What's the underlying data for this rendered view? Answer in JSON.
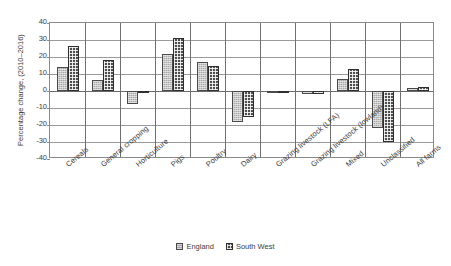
{
  "chart_data": {
    "type": "bar",
    "title": "",
    "xlabel": "",
    "ylabel": "Percentage change, (2010–2016)",
    "ylim": [
      -40,
      40
    ],
    "ytick_values": [
      40,
      30,
      20,
      10,
      0,
      -10,
      -20,
      -30,
      -40
    ],
    "ytick_labels": [
      "40",
      "30",
      "20",
      "10",
      "0",
      "-10",
      "-20",
      "-30",
      "-40"
    ],
    "grid": true,
    "legend_position": "bottom",
    "categories": [
      "Cereals",
      "General cropping",
      "Horticulture",
      "Pigs",
      "Poultry",
      "Dairy",
      "Grazing livestock (LFA)",
      "Grazing livestock (lowland)",
      "Mixed",
      "Unclassified",
      "All farms"
    ],
    "series": [
      {
        "name": "England",
        "pattern": "light-grey-dotted",
        "color": "#a8a8a8",
        "values": [
          14,
          6.5,
          -7.5,
          22,
          17,
          -18.5,
          -0.5,
          -1.5,
          7,
          -22,
          2
        ]
      },
      {
        "name": "South West",
        "pattern": "dark-checkered",
        "color": "#4d4d4d",
        "values": [
          26.5,
          18.5,
          -1,
          31,
          14.5,
          -15.5,
          -0.5,
          -1.5,
          13,
          -30,
          2.5
        ]
      }
    ]
  }
}
